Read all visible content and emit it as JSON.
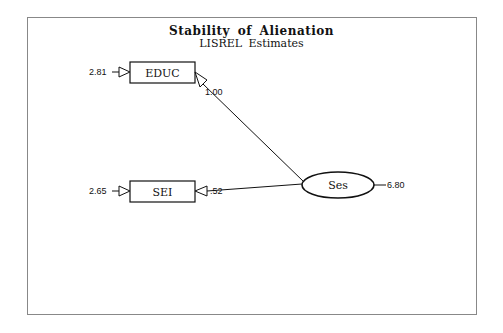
{
  "title": "Stability of Alienation",
  "subtitle": "LISREL Estimates",
  "nodes": {
    "educ": {
      "label": "EDUC",
      "error_variance": "2.81",
      "loading": "1.00"
    },
    "sei": {
      "label": "SEI",
      "error_variance": "2.65",
      "loading": ".52"
    },
    "ses": {
      "label": "Ses",
      "variance": "6.80"
    }
  },
  "colors": {
    "line": "#111111",
    "frame": "#888888",
    "background": "#ffffff"
  }
}
